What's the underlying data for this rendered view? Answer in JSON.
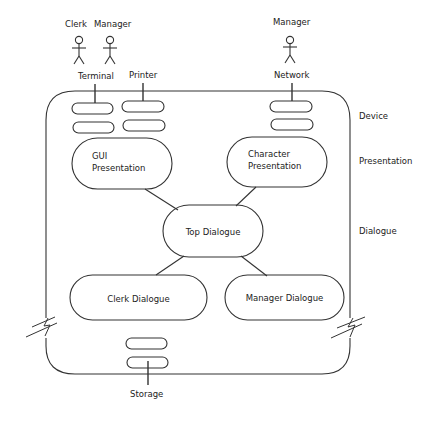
{
  "diagram": {
    "actors": [
      {
        "id": "clerk",
        "label": "Clerk"
      },
      {
        "id": "manager-terminal",
        "label": "Manager"
      },
      {
        "id": "manager-network",
        "label": "Manager"
      }
    ],
    "devices": {
      "terminal": "Terminal",
      "printer": "Printer",
      "network": "Network",
      "storage": "Storage"
    },
    "layers": {
      "device": "Device",
      "presentation": "Presentation",
      "dialogue": "Dialogue"
    },
    "nodes": {
      "gui_presentation": {
        "line1": "GUI",
        "line2": "Presentation"
      },
      "character_presentation": {
        "line1": "Character",
        "line2": "Presentation"
      },
      "top_dialogue": "Top Dialogue",
      "clerk_dialogue": "Clerk Dialogue",
      "manager_dialogue": "Manager Dialogue"
    },
    "colors": {
      "stroke": "#333333",
      "text": "#222222",
      "background": "#ffffff"
    }
  }
}
